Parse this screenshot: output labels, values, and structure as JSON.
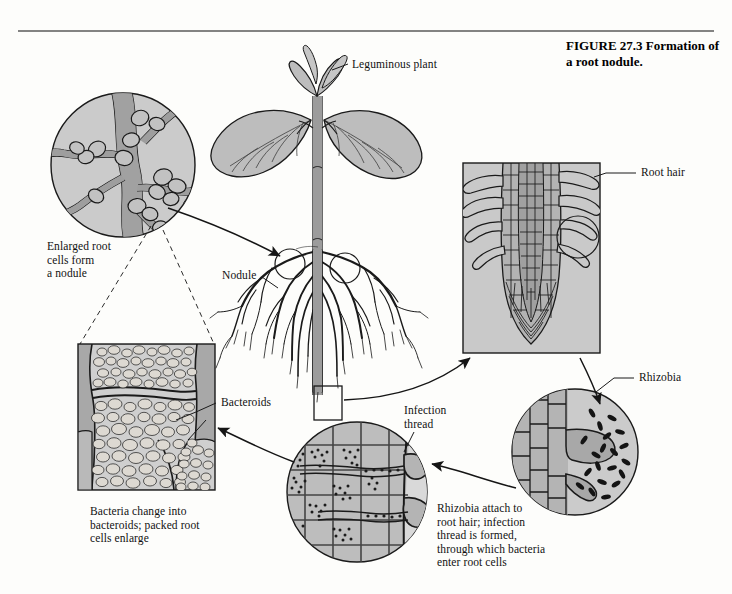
{
  "figure": {
    "title_line1": "FIGURE 27.3    Formation of",
    "title_line2": "a root nodule.",
    "title_full": "FIGURE 27.3 Formation of a root nodule."
  },
  "labels": {
    "leguminous_plant": "Leguminous plant",
    "enlarged_root_cells": "Enlarged root\ncells form\na nodule",
    "nodule": "Nodule",
    "root_hair": "Root hair",
    "rhizobia": "Rhizobia",
    "bacteroids": "Bacteroids",
    "infection_thread": "Infection\nthread",
    "bacteria_change": "Bacteria change into\nbacteroids; packed root\ncells enlarge",
    "rhizobia_attach": "Rhizobia attach to\nroot hair; infection\nthread is formed,\nthrough which bacteria\nenter root cells"
  },
  "panels": {
    "nodule_closeup": "enlarged-root-nodule-circle",
    "root_tip": "root-tip-with-root-hairs-panel",
    "rhizobia_closeup": "rhizobia-attaching-circle",
    "infection_thread_closeup": "infection-thread-circle",
    "bacteroid_cells": "bacteroid-packed-cells-panel",
    "plant": "leguminous-plant-illustration"
  },
  "colors": {
    "panel_fill": "#c9c9c9",
    "panel_light": "#d8d8d8",
    "cell_fill": "#b6b6b6",
    "root_fill": "#9a9a9a",
    "ink": "#1a1a1a",
    "paper": "#fdfdfb",
    "bacteria": "#161616"
  }
}
